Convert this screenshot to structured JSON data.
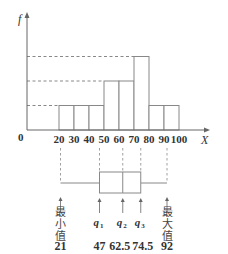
{
  "chart_data": [
    {
      "type": "bar",
      "subtype": "histogram",
      "title": "",
      "xlabel": "X",
      "ylabel": "f",
      "origin_label": "0",
      "bins": [
        {
          "from": 20,
          "to": 30,
          "level": 1
        },
        {
          "from": 30,
          "to": 40,
          "level": 1
        },
        {
          "from": 40,
          "to": 50,
          "level": 1
        },
        {
          "from": 50,
          "to": 60,
          "level": 2
        },
        {
          "from": 60,
          "to": 70,
          "level": 2
        },
        {
          "from": 70,
          "to": 80,
          "level": 3
        },
        {
          "from": 80,
          "to": 90,
          "level": 1
        },
        {
          "from": 90,
          "to": 100,
          "level": 1
        }
      ],
      "x_tick_labels": [
        "20",
        "30",
        "40",
        "50",
        "60",
        "70",
        "80",
        "90",
        "100"
      ],
      "x_ticks": [
        20,
        30,
        40,
        50,
        60,
        70,
        80,
        90,
        100
      ],
      "xlim": [
        0,
        110
      ],
      "ylim": [
        0,
        4.2
      ],
      "reference_levels": [
        1,
        2,
        3
      ],
      "y_tick_labels": [],
      "grid": false,
      "legend": "none"
    },
    {
      "type": "boxplot",
      "min": 21,
      "q1": 47,
      "q2": 62.5,
      "q3": 74.5,
      "max": 92,
      "labels": {
        "min": [
          "最",
          "小",
          "值"
        ],
        "max": [
          "最",
          "大",
          "值"
        ],
        "q1": {
          "base": "q",
          "sub": "1"
        },
        "q2": {
          "base": "q",
          "sub": "2"
        },
        "q3": {
          "base": "q",
          "sub": "3"
        }
      },
      "value_labels": {
        "min": "21",
        "q1": "47",
        "q2": "62.5",
        "q3": "74.5",
        "max": "92"
      }
    }
  ],
  "colors": {
    "line": "#888888",
    "axis": "#666666",
    "text": "#333333"
  }
}
